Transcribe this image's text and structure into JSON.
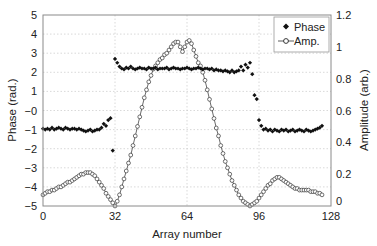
{
  "chart_data": {
    "type": "scatter",
    "title": "",
    "xlabel": "Array number",
    "ylabel": "Phase (rad.)",
    "y2label": "Amplitude (arb.)",
    "xlim": [
      0,
      128
    ],
    "ylim": [
      -5,
      5
    ],
    "y2lim": [
      0,
      1.2
    ],
    "grid": true,
    "legend_position": "upper right",
    "x_ticks": [
      0,
      32,
      64,
      96,
      128
    ],
    "x_tick_labels": [
      "0",
      "32",
      "64",
      "96",
      "128"
    ],
    "y_ticks": [
      5,
      4,
      3,
      2,
      1,
      0,
      -1,
      -2,
      -3,
      -4,
      -5
    ],
    "y_tick_labels": [
      "5",
      "4",
      "3",
      "2",
      "1",
      "−0",
      "−1",
      "−2",
      "−3",
      "−4",
      "−5"
    ],
    "y2_ticks": [
      1.2,
      1,
      0.8,
      0.6,
      0.4,
      0.2,
      0
    ],
    "y2_tick_labels": [
      "1.2",
      "1",
      "0.8",
      "0.6",
      "0.4",
      "0.2",
      "0"
    ],
    "series": [
      {
        "name": "Phase",
        "axis": "left",
        "marker": "diamond-filled",
        "color": "#111111",
        "x": [
          0,
          1,
          2,
          3,
          4,
          5,
          6,
          7,
          8,
          9,
          10,
          11,
          12,
          13,
          14,
          15,
          16,
          17,
          18,
          19,
          20,
          21,
          22,
          23,
          24,
          25,
          26,
          27,
          28,
          29,
          30,
          31,
          32,
          33,
          34,
          35,
          36,
          37,
          38,
          39,
          40,
          41,
          42,
          43,
          44,
          45,
          46,
          47,
          48,
          49,
          50,
          51,
          52,
          53,
          54,
          55,
          56,
          57,
          58,
          59,
          60,
          61,
          62,
          63,
          64,
          65,
          66,
          67,
          68,
          69,
          70,
          71,
          72,
          73,
          74,
          75,
          76,
          77,
          78,
          79,
          80,
          81,
          82,
          83,
          84,
          85,
          86,
          87,
          88,
          89,
          90,
          91,
          92,
          93,
          94,
          95,
          96,
          97,
          98,
          99,
          100,
          101,
          102,
          103,
          104,
          105,
          106,
          107,
          108,
          109,
          110,
          111,
          112,
          113,
          114,
          115,
          116,
          117,
          118,
          119,
          120,
          121,
          122,
          123,
          124
        ],
        "values": [
          -0.95,
          -1.0,
          -0.95,
          -1.0,
          -0.9,
          -1.0,
          -0.95,
          -0.9,
          -0.95,
          -1.0,
          -0.9,
          -0.95,
          -1.0,
          -0.95,
          -0.95,
          -1.0,
          -0.95,
          -1.0,
          -1.05,
          -1.1,
          -1.05,
          -1.0,
          -1.1,
          -1.05,
          -1.0,
          -1.0,
          -0.9,
          -0.7,
          -0.8,
          -0.5,
          -0.4,
          -2.1,
          2.7,
          2.5,
          2.3,
          2.2,
          2.15,
          2.25,
          2.2,
          2.3,
          2.2,
          2.15,
          2.2,
          2.25,
          2.2,
          2.2,
          2.15,
          2.25,
          2.2,
          2.2,
          2.25,
          2.15,
          2.2,
          2.2,
          2.2,
          2.25,
          2.15,
          2.2,
          2.25,
          2.2,
          2.2,
          2.15,
          2.2,
          2.2,
          2.25,
          2.2,
          2.15,
          2.2,
          2.2,
          2.25,
          2.2,
          2.15,
          2.2,
          2.2,
          2.15,
          2.2,
          2.1,
          2.15,
          2.1,
          2.1,
          2.05,
          2.1,
          2.05,
          2.0,
          2.1,
          2.0,
          2.05,
          2.1,
          2.3,
          2.1,
          2.4,
          2.25,
          2.5,
          1.9,
          0.8,
          0.6,
          -0.5,
          -0.8,
          -1.0,
          -0.95,
          -1.05,
          -1.0,
          -1.1,
          -1.0,
          -1.05,
          -1.1,
          -1.0,
          -1.05,
          -1.0,
          -1.1,
          -1.05,
          -1.0,
          -1.1,
          -1.05,
          -1.0,
          -1.05,
          -1.1,
          -1.0,
          -1.05,
          -1.1,
          -1.05,
          -1.0,
          -0.95,
          -0.9,
          -0.8
        ]
      },
      {
        "name": "Amp.",
        "axis": "right",
        "marker": "circle-open",
        "line": true,
        "color": "#111111",
        "x": [
          0,
          1,
          2,
          3,
          4,
          5,
          6,
          7,
          8,
          9,
          10,
          11,
          12,
          13,
          14,
          15,
          16,
          17,
          18,
          19,
          20,
          21,
          22,
          23,
          24,
          25,
          26,
          27,
          28,
          29,
          30,
          31,
          32,
          33,
          34,
          35,
          36,
          37,
          38,
          39,
          40,
          41,
          42,
          43,
          44,
          45,
          46,
          47,
          48,
          49,
          50,
          51,
          52,
          53,
          54,
          55,
          56,
          57,
          58,
          59,
          60,
          61,
          62,
          63,
          64,
          65,
          66,
          67,
          68,
          69,
          70,
          71,
          72,
          73,
          74,
          75,
          76,
          77,
          78,
          79,
          80,
          81,
          82,
          83,
          84,
          85,
          86,
          87,
          88,
          89,
          90,
          91,
          92,
          93,
          94,
          95,
          96,
          97,
          98,
          99,
          100,
          101,
          102,
          103,
          104,
          105,
          106,
          107,
          108,
          109,
          110,
          111,
          112,
          113,
          114,
          115,
          116,
          117,
          118,
          119,
          120,
          121,
          122,
          123,
          124
        ],
        "values": [
          0.07,
          0.08,
          0.09,
          0.09,
          0.1,
          0.1,
          0.11,
          0.12,
          0.12,
          0.13,
          0.14,
          0.15,
          0.15,
          0.16,
          0.17,
          0.18,
          0.19,
          0.2,
          0.2,
          0.21,
          0.21,
          0.21,
          0.2,
          0.19,
          0.17,
          0.15,
          0.13,
          0.11,
          0.08,
          0.06,
          0.04,
          0.02,
          0.0,
          0.03,
          0.07,
          0.12,
          0.17,
          0.22,
          0.27,
          0.32,
          0.38,
          0.44,
          0.5,
          0.56,
          0.62,
          0.68,
          0.73,
          0.78,
          0.82,
          0.86,
          0.88,
          0.9,
          0.92,
          0.93,
          0.95,
          0.96,
          0.98,
          1.0,
          1.02,
          1.03,
          1.03,
          1.0,
          0.97,
          1.0,
          1.03,
          1.04,
          1.02,
          0.98,
          0.94,
          0.9,
          0.88,
          0.84,
          0.79,
          0.73,
          0.67,
          0.61,
          0.55,
          0.49,
          0.44,
          0.38,
          0.33,
          0.28,
          0.24,
          0.2,
          0.16,
          0.13,
          0.1,
          0.07,
          0.05,
          0.03,
          0.02,
          0.01,
          0.0,
          0.01,
          0.02,
          0.03,
          0.05,
          0.07,
          0.09,
          0.11,
          0.13,
          0.14,
          0.16,
          0.17,
          0.18,
          0.18,
          0.17,
          0.16,
          0.15,
          0.14,
          0.13,
          0.12,
          0.11,
          0.11,
          0.1,
          0.1,
          0.1,
          0.1,
          0.1,
          0.09,
          0.09,
          0.09,
          0.08,
          0.08,
          0.07
        ]
      }
    ]
  },
  "legend": {
    "items": [
      {
        "label": "Phase",
        "marker": "diamond-filled"
      },
      {
        "label": "Amp.",
        "marker": "circle-open"
      }
    ]
  },
  "axes": {
    "xlabel": "Array number",
    "ylabel_left": "Phase (rad.)",
    "ylabel_right": "Amplitude (arb.)"
  },
  "colors": {
    "ink": "#111111",
    "frame": "#8a8a8a",
    "grid": "#c8c8c8",
    "background": "#ffffff"
  }
}
